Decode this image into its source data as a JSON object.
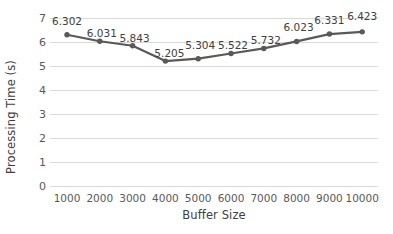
{
  "chart_data": {
    "type": "line",
    "title": "",
    "xlabel": "Buffer Size",
    "ylabel": "Processing Time (s)",
    "categories": [
      "1000",
      "2000",
      "3000",
      "4000",
      "5000",
      "6000",
      "7000",
      "8000",
      "9000",
      "10000"
    ],
    "values": [
      6.302,
      6.031,
      5.843,
      5.205,
      5.304,
      5.522,
      5.732,
      6.023,
      6.331,
      6.423
    ],
    "data_labels": [
      "6.302",
      "6.031",
      "5.843",
      "5.205",
      "5.304",
      "5.522",
      "5.732",
      "6.023",
      "6.331",
      "6.423"
    ],
    "ylim": [
      0,
      7
    ],
    "y_ticks": [
      "7",
      "6",
      "5",
      "4",
      "3",
      "2",
      "1",
      "0"
    ],
    "y_tick_values": [
      7,
      6,
      5,
      4,
      3,
      2,
      1,
      0
    ],
    "grid": true,
    "legend": "none",
    "series_color": "#595959",
    "gridline_color": "#d9d9d9",
    "text_color": "#404040",
    "marker": "circle"
  }
}
